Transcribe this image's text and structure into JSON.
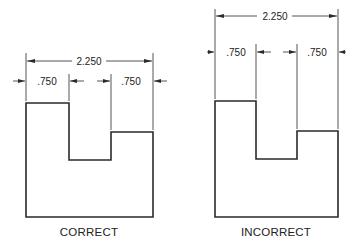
{
  "figures": [
    {
      "id": "correct",
      "caption": "CORRECT",
      "overall_dimension": "2.250",
      "left_dimension": ".750",
      "right_dimension": ".750"
    },
    {
      "id": "incorrect",
      "caption": "INCORRECT",
      "overall_dimension": "2.250",
      "left_dimension": ".750",
      "right_dimension": ".750"
    }
  ],
  "colors": {
    "line": "#2a2a2a",
    "background": "#ffffff"
  }
}
